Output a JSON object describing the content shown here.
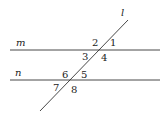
{
  "diagram": {
    "type": "parallel-lines-transversal",
    "lines": {
      "m": {
        "label": "m"
      },
      "n": {
        "label": "n"
      },
      "transversal": {
        "label": "l"
      }
    },
    "angles": [
      "1",
      "2",
      "3",
      "4",
      "5",
      "6",
      "7",
      "8"
    ],
    "colors": {
      "stroke": "#333333",
      "text": "#222222",
      "background": "#ffffff"
    }
  }
}
